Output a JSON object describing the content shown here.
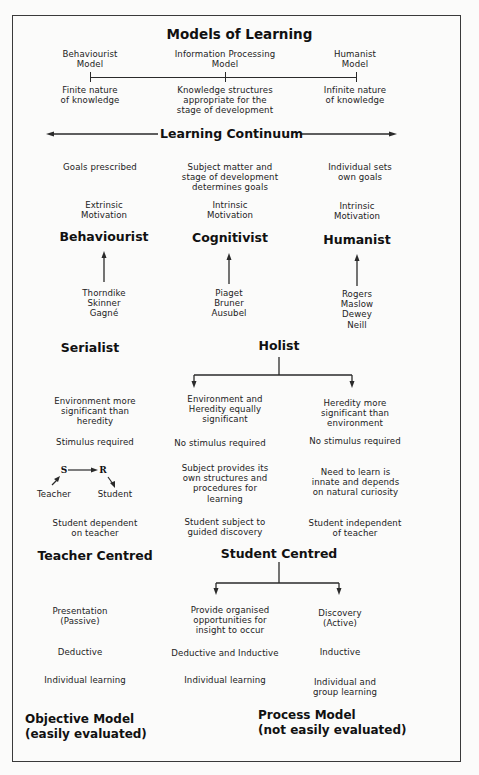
{
  "title": "Models of Learning",
  "models": [
    {
      "name": "Behaviourist\nModel",
      "note": "Finite nature\nof knowledge"
    },
    {
      "name": "Information Processing\nModel",
      "note": "Knowledge structures\nappropriate for the\nstage of development"
    },
    {
      "name": "Humanist\nModel",
      "note": "Infinite nature\nof knowledge"
    }
  ],
  "continuum_label": "Learning Continuum",
  "goals": [
    "Goals prescribed",
    "Subject matter and\nstage of development\ndetermines goals",
    "Individual sets\nown goals"
  ],
  "motivation": [
    "Extrinsic\nMotivation",
    "Intrinsic\nMotivation",
    "Intrinsic\nMotivation"
  ],
  "schools": [
    {
      "name": "Behaviourist",
      "theorists": "Thorndike\nSkinner\nGagné"
    },
    {
      "name": "Cognitivist",
      "theorists": "Piaget\nBruner\nAusubel"
    },
    {
      "name": "Humanist",
      "theorists": "Rogers\nMaslow\nDewey\nNeill"
    }
  ],
  "styles": {
    "serialist": "Serialist",
    "holist": "Holist"
  },
  "significance": [
    "Environment more\nsignificant than\nheredity",
    "Environment and\nHeredity equally\nsignificant",
    "Heredity more\nsignificant than\nenvironment"
  ],
  "stimulus": [
    "Stimulus required",
    "No stimulus required",
    "No stimulus required"
  ],
  "sr_diagram": {
    "s": "S",
    "r": "R",
    "teacher": "Teacher",
    "student": "Student"
  },
  "structures": [
    "Subject provides its\nown structures and\nprocedures for\nlearning",
    "Need to learn is\ninnate and depends\non natural curiosity"
  ],
  "dependence": [
    "Student dependent\non teacher",
    "Student subject to\nguided discovery",
    "Student independent\nof teacher"
  ],
  "centred": {
    "teacher": "Teacher Centred",
    "student": "Student Centred"
  },
  "method": [
    "Presentation\n(Passive)",
    "Provide organised\nopportunities for\ninsight to occur",
    "Discovery\n(Active)"
  ],
  "reasoning": [
    "Deductive",
    "Deductive and Inductive",
    "Inductive"
  ],
  "grouping": [
    "Individual learning",
    "Individual learning",
    "Individual and\ngroup learning"
  ],
  "outcome_models": [
    {
      "name": "Objective Model",
      "note": "(easily evaluated)"
    },
    {
      "name": "Process Model",
      "note": "(not easily evaluated)"
    }
  ]
}
